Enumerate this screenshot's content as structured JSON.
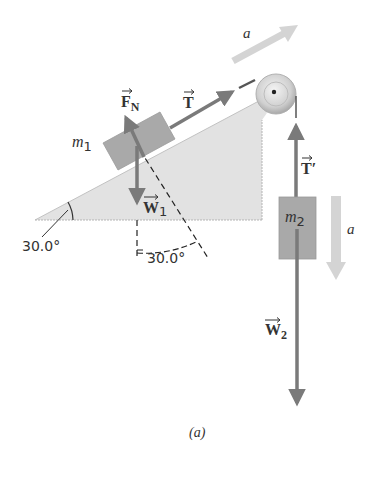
{
  "figure": {
    "caption": "(a)",
    "colors": {
      "wedge_fill": "#e2e2e2",
      "wedge_edge": "#b8b8b8",
      "block_fill": "#a9a9a9",
      "vector": "#7a7a7a",
      "accel_arrow": "#d4d4d4",
      "text": "#333333",
      "pulley": "#cfcfcf"
    },
    "wedge": {
      "angle_label": "30.0°"
    },
    "block1": {
      "label_main": "m",
      "label_sub": "1"
    },
    "block2": {
      "label_main": "m",
      "label_sub": "2"
    },
    "vectors": {
      "normal_force": {
        "main": "F",
        "sub": "N"
      },
      "tension": {
        "main": "T",
        "sub": ""
      },
      "weight1": {
        "main": "W",
        "sub": "1"
      },
      "tension_prime": {
        "main": "T′",
        "sub": ""
      },
      "weight2": {
        "main": "W",
        "sub": "2"
      }
    },
    "acceleration": {
      "incline_label": "a",
      "hanging_label": "a"
    },
    "angle_between_w1_and_normal": "30.0°"
  }
}
